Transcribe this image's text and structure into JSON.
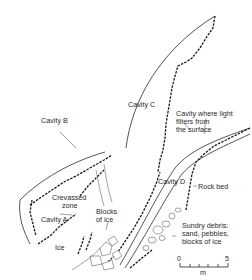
{
  "diagram": {
    "type": "cross-section sketch of glacier ice cavities",
    "labels": {
      "cavity_a": "Cavity A",
      "cavity_b": "Cavity B",
      "cavity_c": "Cavity C",
      "cavity_d": "Cavity D",
      "crevassed_1": "Crevassed",
      "crevassed_2": "zone",
      "blocks_1": "Blocks",
      "blocks_2": "of ice",
      "ice": "Ice",
      "light_1": "Cavity where light",
      "light_2": "filters from",
      "light_3": "the surface",
      "rock_bed": "Rock bed",
      "debris_1": "Sundry debris:",
      "debris_2": "sand, pebbles,",
      "debris_3": "blocks of ice"
    },
    "scale_bar": {
      "start": "0",
      "end": "5",
      "unit": "m"
    },
    "colors": {
      "ink": "#2a2a2a",
      "background": "#ffffff"
    }
  }
}
